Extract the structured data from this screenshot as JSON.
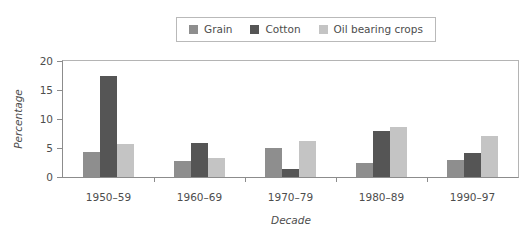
{
  "chart_data": {
    "type": "bar",
    "title": "",
    "xlabel": "Decade",
    "ylabel": "Percentage",
    "categories": [
      "1950–59",
      "1960–69",
      "1970–79",
      "1980–89",
      "1990–97"
    ],
    "series": [
      {
        "name": "Grain",
        "color": "#8e8e8e",
        "values": [
          4.3,
          2.7,
          5.0,
          2.4,
          2.9
        ]
      },
      {
        "name": "Cotton",
        "color": "#555555",
        "values": [
          17.5,
          5.8,
          1.4,
          8.0,
          4.2
        ]
      },
      {
        "name": "Oil bearing crops",
        "color": "#c4c4c4",
        "values": [
          5.7,
          3.2,
          6.2,
          8.6,
          7.1
        ]
      }
    ],
    "ylim": [
      0,
      20
    ],
    "yticks": [
      0,
      5,
      10,
      15,
      20
    ],
    "ytick_labels": [
      "0",
      "5",
      "10",
      "15",
      "20"
    ],
    "grid": false,
    "legend_position": "top-center"
  }
}
